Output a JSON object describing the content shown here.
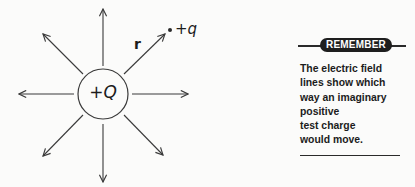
{
  "diagram": {
    "source_charge": {
      "sign": "+",
      "symbol": "Q"
    },
    "test_charge": {
      "sign": "+",
      "symbol": "q"
    },
    "distance_label": "r",
    "field_line_count": 8,
    "field_line_direction": "outward",
    "colors": {
      "ink": "#3a3a3a",
      "background": "#fbfbfa"
    }
  },
  "remember_box": {
    "header": "REMEMBER",
    "lines": [
      "The electric field",
      "lines show which",
      "way an imaginary",
      "positive",
      "test charge",
      "would move."
    ],
    "colors": {
      "pill_bg": "#1e1e1e",
      "pill_text": "#ffffff",
      "text": "#1c1c1c"
    }
  }
}
